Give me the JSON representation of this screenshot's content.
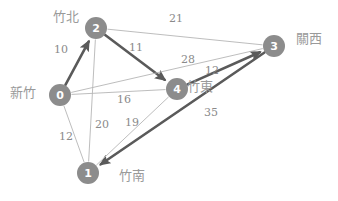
{
  "diagram": {
    "type": "weighted-graph",
    "colors": {
      "node_fill": "#8c8c8c",
      "node_text": "#ffffff",
      "edge_thin": "#b5b5b5",
      "edge_bold": "#5a5a5a",
      "weight_text": "#8a8a8a",
      "place_text": "#9a9a9a",
      "background": "#ffffff"
    },
    "nodes": [
      {
        "id": "0",
        "label": "0",
        "place": "新竹",
        "x": 60,
        "y": 95,
        "r": 11,
        "place_x": 10,
        "place_y": 86
      },
      {
        "id": "1",
        "label": "1",
        "place": "竹南",
        "x": 88,
        "y": 173,
        "r": 11,
        "place_x": 119,
        "place_y": 169
      },
      {
        "id": "2",
        "label": "2",
        "place": "竹北",
        "x": 96,
        "y": 28,
        "r": 11,
        "place_x": 53,
        "place_y": 10
      },
      {
        "id": "3",
        "label": "3",
        "place": "關西",
        "x": 274,
        "y": 46,
        "r": 11,
        "place_x": 296,
        "place_y": 32
      },
      {
        "id": "4",
        "label": "4",
        "place": "竹東",
        "x": 177,
        "y": 89,
        "r": 11,
        "place_x": 187,
        "place_y": 80
      }
    ],
    "edges": [
      {
        "from": "0",
        "to": "2",
        "weight": "10",
        "style": "bold",
        "arrow": true,
        "label_x": 54,
        "label_y": 44
      },
      {
        "from": "2",
        "to": "4",
        "weight": "11",
        "style": "bold",
        "arrow": true,
        "label_x": 129,
        "label_y": 42
      },
      {
        "from": "4",
        "to": "3",
        "weight": "12",
        "style": "bold",
        "arrow": true,
        "label_x": 205,
        "label_y": 65
      },
      {
        "from": "3",
        "to": "1",
        "weight": "35",
        "style": "bold",
        "arrow": true,
        "label_x": 204,
        "label_y": 107
      },
      {
        "from": "2",
        "to": "3",
        "weight": "21",
        "style": "thin",
        "arrow": false,
        "label_x": 169,
        "label_y": 13
      },
      {
        "from": "0",
        "to": "3",
        "weight": "28",
        "style": "thin",
        "arrow": false,
        "label_x": 181,
        "label_y": 54
      },
      {
        "from": "0",
        "to": "4",
        "weight": "16",
        "style": "thin",
        "arrow": false,
        "label_x": 117,
        "label_y": 94
      },
      {
        "from": "0",
        "to": "1",
        "weight": "12",
        "style": "thin",
        "arrow": false,
        "label_x": 59,
        "label_y": 131
      },
      {
        "from": "1",
        "to": "2",
        "weight": "20",
        "style": "thin",
        "arrow": false,
        "label_x": 95,
        "label_y": 119
      },
      {
        "from": "1",
        "to": "4",
        "weight": "19",
        "style": "thin",
        "arrow": false,
        "label_x": 125,
        "label_y": 117
      }
    ]
  }
}
